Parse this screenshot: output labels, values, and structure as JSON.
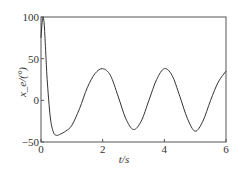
{
  "chart_data": {
    "type": "line",
    "title": "",
    "xlabel": "t/s",
    "ylabel": "x_e/(°)",
    "xlim": [
      0,
      6
    ],
    "ylim": [
      -50,
      100
    ],
    "xticks": [
      "0",
      "2",
      "4",
      "6"
    ],
    "yticks": [
      "-50",
      "0",
      "50",
      "100"
    ],
    "grid": false,
    "series": [
      {
        "name": "x_e",
        "x": [
          0,
          0.05,
          0.1,
          0.15,
          0.2,
          0.3,
          0.4,
          0.5,
          0.6,
          0.8,
          1.0,
          1.25,
          1.5,
          1.75,
          2.0,
          2.25,
          2.5,
          2.75,
          3.0,
          3.25,
          3.5,
          3.75,
          4.0,
          4.25,
          4.5,
          4.75,
          5.0,
          5.25,
          5.5,
          5.75,
          6.0
        ],
        "values": [
          75,
          98,
          93,
          60,
          25,
          -20,
          -38,
          -42,
          -41,
          -37,
          -30,
          -10,
          15,
          32,
          38,
          30,
          5,
          -22,
          -35,
          -25,
          0,
          25,
          38,
          30,
          5,
          -22,
          -37,
          -25,
          0,
          22,
          35
        ]
      }
    ]
  }
}
